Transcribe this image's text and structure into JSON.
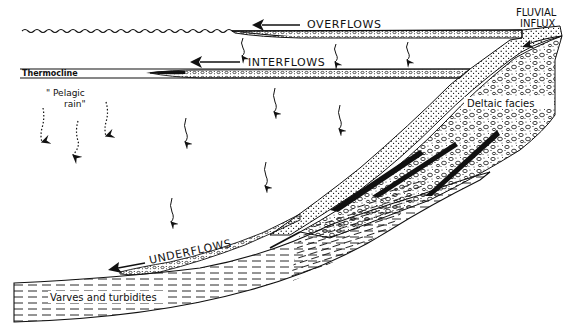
{
  "figure": {
    "type": "lake sedimentation cross-section",
    "colors": {
      "ink": "#111111",
      "background": "#ffffff"
    }
  },
  "labels": {
    "overflows": "OVERFLOWS",
    "interflows": "INTERFLOWS",
    "underflows": "UNDERFLOWS",
    "fluvial_line1": "FLUVIAL",
    "fluvial_line2": "INFLUX",
    "thermocline": "Thermocline",
    "pelagic_line1": "\" Pelagic",
    "pelagic_line2": "rain\"",
    "deltaic": "Deltaic facies",
    "varves": "Varves and turbidites"
  },
  "elements": {
    "water_surface": "wavy-line",
    "flow_arrows": [
      "overflows-arrow",
      "interflows-arrow",
      "underflows-arrow",
      "fluvial-influx-arrow"
    ],
    "settling_arrows_wavy": 9,
    "settling_arrows_dotted": 3,
    "delta_wedges": 3
  }
}
